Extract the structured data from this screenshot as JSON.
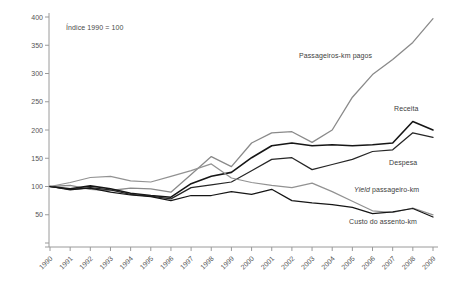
{
  "chart_data": {
    "type": "line",
    "title": "",
    "axis_note": "Índice 1990 = 100",
    "grid": false,
    "legend_position": "inline-labels-right",
    "x": [
      "1990",
      "1991",
      "1992",
      "1993",
      "1994",
      "1995",
      "1996",
      "1997",
      "1998",
      "1999",
      "2000",
      "2001",
      "2002",
      "2003",
      "2004",
      "2005",
      "2006",
      "2007",
      "2008",
      "2009"
    ],
    "ylim": [
      0,
      400
    ],
    "yticks": [
      50,
      100,
      150,
      200,
      250,
      300,
      350,
      400
    ],
    "axis_color": "#9a9a9a",
    "tick_label_color": "#555555",
    "series": [
      {
        "name": "Passageiros-km pagos",
        "color": "#8a8a8a",
        "width": 1.3,
        "values": [
          100,
          102,
          95,
          93,
          97,
          96,
          90,
          121,
          153,
          135,
          177,
          195,
          197,
          178,
          200,
          258,
          298,
          325,
          355,
          397
        ]
      },
      {
        "name": "Receita",
        "color": "#161616",
        "width": 1.6,
        "values": [
          100,
          96,
          101,
          96,
          88,
          84,
          81,
          105,
          118,
          125,
          151,
          172,
          177,
          172,
          174,
          172,
          174,
          177,
          215,
          200
        ]
      },
      {
        "name": "Despesa",
        "color": "#262626",
        "width": 1.25,
        "values": [
          100,
          94,
          98,
          94,
          86,
          83,
          78,
          98,
          103,
          108,
          128,
          148,
          151,
          130,
          139,
          148,
          162,
          165,
          195,
          187
        ]
      },
      {
        "name": "Yield passageiro-km",
        "name_italic_part": "Yield",
        "name_rest": " passageiro-km",
        "color": "#929292",
        "width": 1.25,
        "values": [
          100,
          107,
          116,
          118,
          110,
          108,
          118,
          128,
          140,
          115,
          107,
          102,
          98,
          106,
          91,
          74,
          57,
          54,
          62,
          50
        ]
      },
      {
        "name": "Custo do assento-km",
        "color": "#161616",
        "width": 1.25,
        "values": [
          100,
          95,
          97,
          90,
          85,
          82,
          75,
          84,
          84,
          91,
          86,
          95,
          75,
          71,
          68,
          63,
          52,
          55,
          61,
          46
        ]
      }
    ]
  }
}
